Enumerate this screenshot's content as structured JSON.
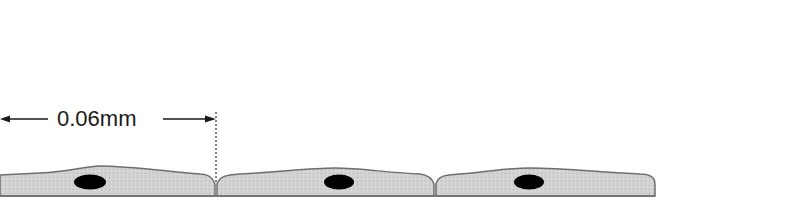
{
  "diagram": {
    "type": "squamous epithelium cross-section",
    "measurement_label": "0.06mm",
    "cell_count": 3,
    "colors": {
      "cytoplasm": "#cfcfcf",
      "outline": "#6e6e6e",
      "nucleus": "#000000",
      "arrow": "#1a1a1a"
    }
  }
}
